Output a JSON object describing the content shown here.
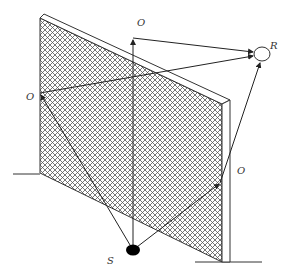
{
  "diagram": {
    "colors": {
      "line": "#333333",
      "hatch": "#555555",
      "background": "#ffffff",
      "source_fill": "#000000"
    },
    "labels": {
      "source": "S",
      "receiver": "R",
      "point_top": "O",
      "point_left": "O",
      "point_right": "O"
    },
    "points": {
      "source": [
        133,
        250
      ],
      "receiver": [
        262,
        54
      ],
      "top_edge": [
        133,
        38
      ],
      "left_edge": [
        40,
        93
      ],
      "right_edge": [
        220,
        183
      ]
    },
    "paths": [
      {
        "name": "over-top",
        "from": "source",
        "via": "top_edge",
        "to": "receiver"
      },
      {
        "name": "around-left",
        "from": "source",
        "via": "left_edge",
        "to": "receiver"
      },
      {
        "name": "around-right",
        "from": "source",
        "via": "right_edge",
        "to": "receiver"
      }
    ]
  }
}
